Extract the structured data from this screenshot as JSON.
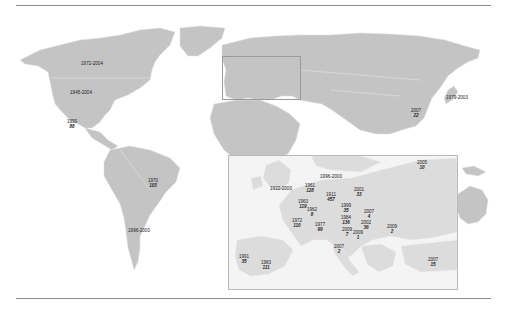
{
  "colors": {
    "land": "#c4c4c4",
    "inset_land": "#dcdcdc",
    "borders": "#e6e6e6",
    "rules": "#8a8a8a",
    "frame": "#b9b9b9",
    "text": "#222222"
  },
  "world_labels": [
    {
      "id": "canada",
      "years": "1972-2004",
      "count": "",
      "x": 92,
      "y": 61
    },
    {
      "id": "usa",
      "years": "1945-2004",
      "count": "",
      "x": 81,
      "y": 90
    },
    {
      "id": "mexico",
      "years": "1990",
      "count": "88",
      "x": 72,
      "y": 119
    },
    {
      "id": "brazil",
      "years": "1970",
      "count": "103",
      "x": 153,
      "y": 178
    },
    {
      "id": "argentina",
      "years": "1996-2000",
      "count": "",
      "x": 139,
      "y": 228
    },
    {
      "id": "china",
      "years": "2007",
      "count": "22",
      "x": 416,
      "y": 108
    },
    {
      "id": "japan",
      "years": "1979-2003",
      "count": "",
      "x": 457,
      "y": 95
    }
  ],
  "inset_labels": [
    {
      "id": "uk",
      "years": "1922-2000",
      "count": "",
      "x": 281,
      "y": 186
    },
    {
      "id": "netherlands",
      "years": "1961",
      "count": "128",
      "x": 310,
      "y": 183
    },
    {
      "id": "denmark-sweden",
      "years": "1996-2000",
      "count": "",
      "x": 331,
      "y": 174
    },
    {
      "id": "germany",
      "years": "1911",
      "count": "457",
      "x": 331,
      "y": 192
    },
    {
      "id": "belgium",
      "years": "1963",
      "count": "119",
      "x": 303,
      "y": 199
    },
    {
      "id": "luxembourg",
      "years": "1962",
      "count": "8",
      "x": 312,
      "y": 207
    },
    {
      "id": "poland",
      "years": "2001",
      "count": "33",
      "x": 359,
      "y": 187
    },
    {
      "id": "czech",
      "years": "1999",
      "count": "35",
      "x": 346,
      "y": 203
    },
    {
      "id": "austria",
      "years": "1984",
      "count": "136",
      "x": 346,
      "y": 215
    },
    {
      "id": "slovakia",
      "years": "2007",
      "count": "4",
      "x": 369,
      "y": 209
    },
    {
      "id": "hungary",
      "years": "2002",
      "count": "36",
      "x": 366,
      "y": 220
    },
    {
      "id": "romania",
      "years": "2009",
      "count": "2",
      "x": 392,
      "y": 224
    },
    {
      "id": "russia",
      "years": "2005",
      "count": "10",
      "x": 422,
      "y": 160
    },
    {
      "id": "france",
      "years": "1972",
      "count": "110",
      "x": 297,
      "y": 218
    },
    {
      "id": "switzerland",
      "years": "1977",
      "count": "99",
      "x": 320,
      "y": 222
    },
    {
      "id": "slovenia",
      "years": "2009",
      "count": "7",
      "x": 347,
      "y": 227
    },
    {
      "id": "croatia",
      "years": "2009",
      "count": "1",
      "x": 358,
      "y": 230
    },
    {
      "id": "italy",
      "years": "2007",
      "count": "2",
      "x": 339,
      "y": 244
    },
    {
      "id": "portugal",
      "years": "1991",
      "count": "35",
      "x": 244,
      "y": 254
    },
    {
      "id": "spain",
      "years": "1983",
      "count": "111",
      "x": 266,
      "y": 260
    },
    {
      "id": "turkey",
      "years": "2007",
      "count": "15",
      "x": 433,
      "y": 257
    }
  ]
}
